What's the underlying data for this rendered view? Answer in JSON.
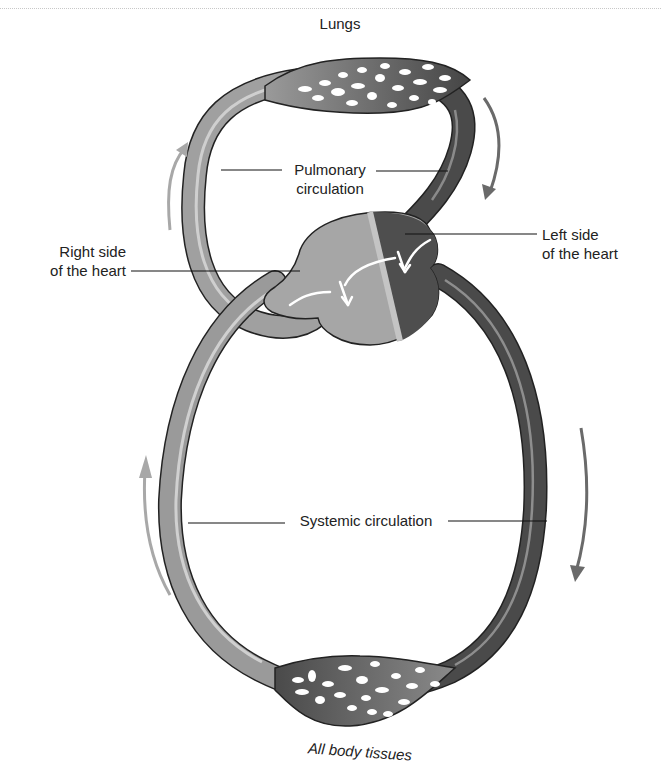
{
  "diagram": {
    "labels": {
      "lungs": "Lungs",
      "pulmonary_line1": "Pulmonary",
      "pulmonary_line2": "circulation",
      "right_heart_line1": "Right side",
      "right_heart_line2": "of the heart",
      "left_heart_line1": "Left side",
      "left_heart_line2": "of the heart",
      "systemic": "Systemic circulation",
      "tissues": "All body tissues"
    },
    "colors": {
      "deoxygenated": "#9a9a9a",
      "oxygenated": "#4a4a4a",
      "arrow_light": "#a8a8a8",
      "arrow_dark": "#6a6a6a",
      "outline": "#222222"
    }
  }
}
